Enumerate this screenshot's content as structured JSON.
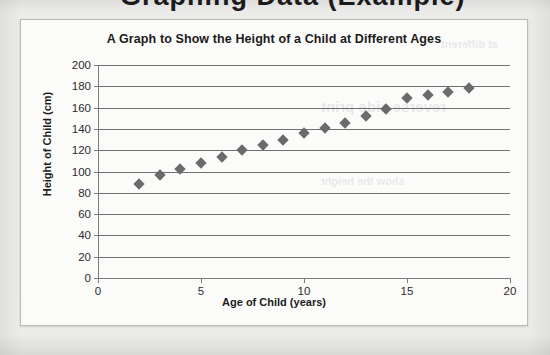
{
  "page": {
    "background_color": "#ebebe9",
    "cut_off_heading_fragment": "Graphing Data  (Example)"
  },
  "chart_card": {
    "background_color": "#fbfbfa",
    "border_color": "#b9b9b7"
  },
  "chart_data": {
    "type": "scatter",
    "title": "A Graph to Show the Height of a Child at Different Ages",
    "xlabel": "Age of Child (years)",
    "ylabel": "Height of Child (cm)",
    "marker": "diamond",
    "marker_color": "#6b6b6b",
    "grid": true,
    "grid_color": "#6f6f6f",
    "legend": "none",
    "xlim": [
      0,
      20
    ],
    "ylim": [
      0,
      200
    ],
    "xticks": [
      0,
      5,
      10,
      15,
      20
    ],
    "yticks": [
      0,
      20,
      40,
      60,
      80,
      100,
      120,
      140,
      160,
      180,
      200
    ],
    "x": [
      2,
      3,
      4,
      5,
      6,
      7,
      8,
      9,
      10,
      11,
      12,
      13,
      14,
      15,
      16,
      17,
      18
    ],
    "y": [
      88,
      97,
      102,
      108,
      114,
      120,
      125,
      130,
      136,
      141,
      146,
      152,
      159,
      169,
      172,
      175,
      178
    ],
    "points": [
      {
        "age": 2,
        "height": 88
      },
      {
        "age": 3,
        "height": 97
      },
      {
        "age": 4,
        "height": 102
      },
      {
        "age": 5,
        "height": 108
      },
      {
        "age": 6,
        "height": 114
      },
      {
        "age": 7,
        "height": 120
      },
      {
        "age": 8,
        "height": 125
      },
      {
        "age": 9,
        "height": 130
      },
      {
        "age": 10,
        "height": 136
      },
      {
        "age": 11,
        "height": 141
      },
      {
        "age": 12,
        "height": 146
      },
      {
        "age": 13,
        "height": 152
      },
      {
        "age": 14,
        "height": 159
      },
      {
        "age": 15,
        "height": 169
      },
      {
        "age": 16,
        "height": 172
      },
      {
        "age": 17,
        "height": 175
      },
      {
        "age": 18,
        "height": 178
      }
    ]
  },
  "ghost_texts": [
    {
      "text": "reverse side print",
      "left": 300,
      "top": 78,
      "size": 15
    },
    {
      "text": "show the height",
      "left": 300,
      "top": 155,
      "size": 11
    },
    {
      "text": "at different",
      "left": 420,
      "top": 18,
      "size": 11
    }
  ]
}
